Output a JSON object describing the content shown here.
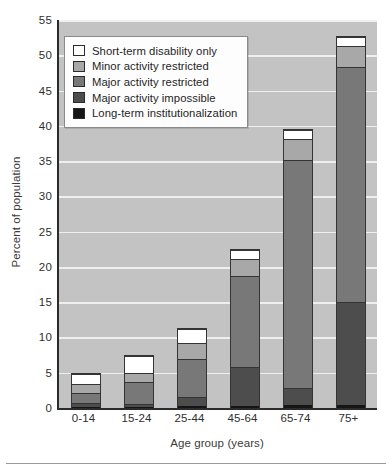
{
  "chart_data": {
    "type": "bar",
    "subtype": "stacked-bar",
    "title": "",
    "xlabel": "Age group (years)",
    "ylabel": "Percent of population",
    "categories": [
      "0-14",
      "15-24",
      "25-44",
      "45-64",
      "65-74",
      "75+"
    ],
    "ylim": [
      0,
      55
    ],
    "yticks": [
      0,
      5,
      10,
      15,
      20,
      25,
      30,
      35,
      40,
      45,
      50,
      55
    ],
    "ytick_labels": [
      "0",
      "5",
      "10",
      "15",
      "20",
      "25",
      "30",
      "35",
      "40",
      "45",
      "50",
      "55"
    ],
    "grid": true,
    "grid_axis": "y",
    "grid_color": "#efefef",
    "plot_background": "#c3c3c3",
    "legend_position": "upper left",
    "series": [
      {
        "name": "Long-term institutionalization",
        "color": "#151515",
        "values": [
          0.2,
          0.2,
          0.3,
          0.3,
          0.4,
          0.5
        ]
      },
      {
        "name": "Major activity impossible",
        "color": "#4d4d4d",
        "values": [
          0.5,
          0.4,
          1.3,
          5.5,
          2.5,
          14.5
        ]
      },
      {
        "name": "Major activity restricted",
        "color": "#787878",
        "values": [
          1.5,
          3.1,
          5.4,
          13.0,
          32.4,
          33.4
        ]
      },
      {
        "name": "Minor activity restricted",
        "color": "#a8a8a8",
        "values": [
          1.3,
          1.4,
          2.3,
          2.4,
          3.0,
          3.1
        ]
      },
      {
        "name": "Short-term disability only",
        "color": "#ffffff",
        "values": [
          1.5,
          2.4,
          2.0,
          1.3,
          1.3,
          1.2
        ]
      }
    ],
    "totals": [
      5.0,
      7.5,
      11.3,
      22.5,
      39.6,
      52.7
    ]
  },
  "legend": {
    "items": [
      {
        "label": "Short-term disability only",
        "color": "#ffffff"
      },
      {
        "label": "Minor activity restricted",
        "color": "#a8a8a8"
      },
      {
        "label": "Major activity restricted",
        "color": "#787878"
      },
      {
        "label": "Major activity impossible",
        "color": "#4d4d4d"
      },
      {
        "label": "Long-term institutionalization",
        "color": "#151515"
      }
    ]
  },
  "caption": {
    "text": ""
  }
}
